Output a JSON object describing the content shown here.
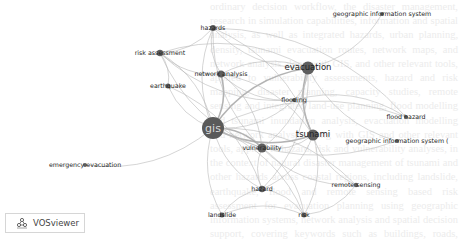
{
  "app": {
    "name": "VOSviewer"
  },
  "background_text": "ordinary decision workflow, the disaster management, research in simulation capabilities, information and spatial analysis, as well as integrated hazards, urban planning, density, tsunami evacuation routes, network maps, and network analysis along with GIS, and other relevant tools, applied to vulnerability assessments, hazard and risk mapping, disaster planning, capacity studies, remote sensing and integrated land-use planning, flood modelling and tsunami inundation analysis, evacuation modelling and network analyses along with GIS and other relevant tools, applied to hazard, risk and vulnerability analyses, in the context of natural disaster management of tsunami and other hazards across coastal regions, including landslide, earthquake, flood and remote sensing based risk assessment for evacuation planning using geographic information systems, network analysis and spatial decision support, covering keywords such as buildings, roads, shelters, hazards, risk and exposure of communities to natural events",
  "network": {
    "nodes": [
      {
        "id": "gis",
        "label": "gis",
        "x": 213,
        "y": 128,
        "r": 11
      },
      {
        "id": "evacuation",
        "label": "evacuation",
        "x": 308,
        "y": 68,
        "r": 6.5
      },
      {
        "id": "tsunami",
        "label": "tsunami",
        "x": 313,
        "y": 135,
        "r": 5.5
      },
      {
        "id": "vulnerability",
        "label": "vulnerability",
        "x": 262,
        "y": 148,
        "r": 4.5
      },
      {
        "id": "network-analysis",
        "label": "network analysis",
        "x": 221,
        "y": 74,
        "r": 3.5
      },
      {
        "id": "hazards",
        "label": "hazards",
        "x": 213,
        "y": 28,
        "r": 3
      },
      {
        "id": "risk-assessment",
        "label": "risk assessment",
        "x": 160,
        "y": 53,
        "r": 3.2
      },
      {
        "id": "earthquake",
        "label": "earthquake",
        "x": 168,
        "y": 86,
        "r": 2.5
      },
      {
        "id": "flooding",
        "label": "flooding",
        "x": 294,
        "y": 100,
        "r": 2
      },
      {
        "id": "flood-hazard",
        "label": "flood hazard",
        "x": 406,
        "y": 117,
        "r": 2
      },
      {
        "id": "geographic-information-system",
        "label": "geographic information system",
        "x": 382,
        "y": 14,
        "r": 2
      },
      {
        "id": "geographic-information-system-2",
        "label": "geographic information system (",
        "x": 397,
        "y": 141,
        "r": 2
      },
      {
        "id": "remote-sensing",
        "label": "remote sensing",
        "x": 356,
        "y": 185,
        "r": 2.2
      },
      {
        "id": "hazard",
        "label": "hazard",
        "x": 262,
        "y": 189,
        "r": 3.2
      },
      {
        "id": "risk",
        "label": "risk",
        "x": 304,
        "y": 215,
        "r": 2.5
      },
      {
        "id": "landslide",
        "label": "landslide",
        "x": 222,
        "y": 215,
        "r": 2.5
      },
      {
        "id": "emergency-evacuation",
        "label": "emergency evacuation",
        "x": 85,
        "y": 165,
        "r": 2
      }
    ],
    "edges": [
      [
        "gis",
        "evacuation"
      ],
      [
        "gis",
        "tsunami"
      ],
      [
        "gis",
        "vulnerability"
      ],
      [
        "gis",
        "network-analysis"
      ],
      [
        "gis",
        "hazards"
      ],
      [
        "gis",
        "risk-assessment"
      ],
      [
        "gis",
        "earthquake"
      ],
      [
        "gis",
        "flooding"
      ],
      [
        "gis",
        "flood-hazard"
      ],
      [
        "gis",
        "geographic-information-system-2"
      ],
      [
        "gis",
        "remote-sensing"
      ],
      [
        "gis",
        "hazard"
      ],
      [
        "gis",
        "risk"
      ],
      [
        "gis",
        "landslide"
      ],
      [
        "gis",
        "emergency-evacuation"
      ],
      [
        "evacuation",
        "tsunami"
      ],
      [
        "evacuation",
        "vulnerability"
      ],
      [
        "evacuation",
        "network-analysis"
      ],
      [
        "evacuation",
        "hazards"
      ],
      [
        "evacuation",
        "risk-assessment"
      ],
      [
        "evacuation",
        "flooding"
      ],
      [
        "evacuation",
        "geographic-information-system"
      ],
      [
        "evacuation",
        "hazard"
      ],
      [
        "evacuation",
        "geographic-information-system-2"
      ],
      [
        "tsunami",
        "vulnerability"
      ],
      [
        "tsunami",
        "hazards"
      ],
      [
        "tsunami",
        "risk"
      ],
      [
        "tsunami",
        "remote-sensing"
      ],
      [
        "tsunami",
        "hazard"
      ],
      [
        "tsunami",
        "network-analysis"
      ],
      [
        "vulnerability",
        "hazards"
      ],
      [
        "vulnerability",
        "hazard"
      ],
      [
        "vulnerability",
        "risk"
      ],
      [
        "vulnerability",
        "network-analysis"
      ],
      [
        "vulnerability",
        "risk-assessment"
      ],
      [
        "vulnerability",
        "remote-sensing"
      ],
      [
        "hazards",
        "risk-assessment"
      ],
      [
        "hazards",
        "network-analysis"
      ],
      [
        "hazards",
        "flood-hazard"
      ],
      [
        "risk-assessment",
        "network-analysis"
      ],
      [
        "risk-assessment",
        "earthquake"
      ],
      [
        "risk-assessment",
        "flooding"
      ],
      [
        "earthquake",
        "hazard"
      ],
      [
        "network-analysis",
        "flooding"
      ],
      [
        "hazard",
        "risk"
      ],
      [
        "hazard",
        "landslide"
      ],
      [
        "landslide",
        "risk"
      ],
      [
        "risk",
        "remote-sensing"
      ],
      [
        "flooding",
        "flood-hazard"
      ]
    ],
    "thick_edges": [
      [
        "gis",
        "evacuation"
      ],
      [
        "gis",
        "tsunami"
      ],
      [
        "gis",
        "vulnerability"
      ],
      [
        "evacuation",
        "tsunami"
      ],
      [
        "gis",
        "network-analysis"
      ]
    ]
  },
  "colors": {
    "node": "#5e5e5e",
    "edge": "#b8b8b8",
    "label": "#1e1e1e"
  }
}
